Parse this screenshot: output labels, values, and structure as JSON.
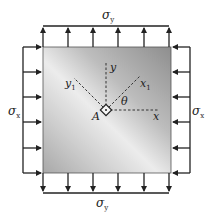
{
  "diagram": {
    "labels": {
      "sigma_y_top": "σ",
      "sigma_y_top_sub": "y",
      "sigma_y_bottom": "σ",
      "sigma_y_bottom_sub": "y",
      "sigma_x_left": "σ",
      "sigma_x_left_sub": "x",
      "sigma_x_right": "σ",
      "sigma_x_right_sub": "x",
      "point": "A",
      "axis_x": "x",
      "axis_y": "y",
      "axis_x1": "x",
      "axis_x1_sub": "1",
      "axis_y1": "y",
      "axis_y1_sub": "1",
      "angle": "θ"
    },
    "colors": {
      "plate_light": "#e6e6e6",
      "plate_dark": "#9a9a9a",
      "line": "#222222"
    },
    "plate": {
      "x": 43,
      "y": 47,
      "width": 128,
      "height": 126
    },
    "arrows": {
      "top_x": [
        43,
        68,
        93,
        118,
        144,
        169
      ],
      "bottom_x": [
        43,
        68,
        93,
        118,
        144,
        169
      ],
      "left_y": [
        47,
        72,
        97,
        122,
        148,
        173
      ],
      "right_y": [
        47,
        72,
        97,
        122,
        148,
        173
      ]
    },
    "origin": {
      "x": 106,
      "y": 110
    }
  }
}
